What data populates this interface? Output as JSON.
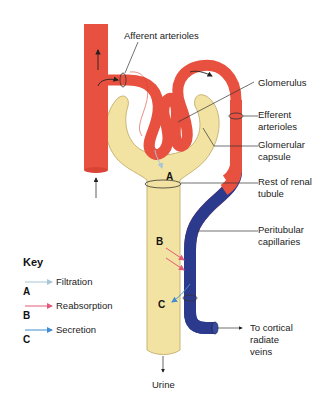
{
  "colors": {
    "artery": "#e8503f",
    "vein": "#2b3a8c",
    "tubule": "#f3e3a2",
    "tubule_outline": "#c8b577",
    "filtration": "#a9c6d4",
    "reabsorption": "#e25a78",
    "secretion": "#3f8fd0"
  },
  "labels": {
    "afferent": "Afferent arterioles",
    "glomerulus": "Glomerulus",
    "efferent_1": "Efferent",
    "efferent_2": "arterioles",
    "capsule_1": "Glomerular",
    "capsule_2": "capsule",
    "rest_1": "Rest of renal",
    "rest_2": "tubule",
    "peri_1": "Peritubular",
    "peri_2": "capillaries",
    "veins_1": "To cortical",
    "veins_2": "radiate",
    "veins_3": "veins",
    "urine": "Urine"
  },
  "markers": {
    "a": "A",
    "b": "B",
    "c": "C"
  },
  "key": {
    "title": "Key",
    "items": [
      {
        "letter": "A",
        "label": "Filtration"
      },
      {
        "letter": "B",
        "label": "Reabsorption"
      },
      {
        "letter": "C",
        "label": "Secretion"
      }
    ]
  }
}
